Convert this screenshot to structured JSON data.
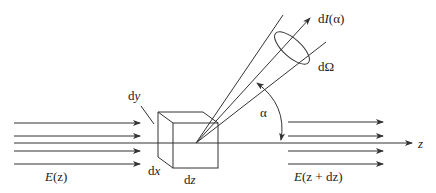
{
  "diagram": {
    "type": "physics-scattering-volume-element",
    "labels": {
      "incident": "E(z)",
      "transmitted": "E(z + dz)",
      "axis": "z",
      "dx": "dx",
      "dy": "dy",
      "dz": "dz",
      "angle": "α",
      "solid_angle": "dΩ",
      "scattered_intensity": "dI(α)"
    },
    "label_parts": {
      "incident_E": "E",
      "incident_arg": "(z)",
      "transmitted_E": "E",
      "transmitted_arg": "(z + dz)",
      "dI_d": "d",
      "dI_I": "I",
      "dI_arg": "(α)",
      "dx_d": "d",
      "dx_x": "x",
      "dy_d": "d",
      "dy_y": "y",
      "dz_d": "d",
      "dz_z": "z"
    },
    "incident_arrow_count": 4,
    "transmitted_arrow_count": 4,
    "colors": {
      "stroke": "#333333",
      "background": "#ffffff"
    }
  }
}
